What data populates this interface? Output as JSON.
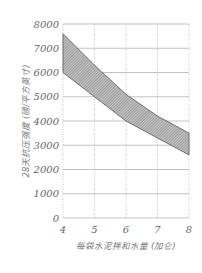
{
  "chart_data": {
    "type": "area",
    "title": "",
    "xlabel": "每袋水泥拌和水量 (加仑)",
    "ylabel": "28天抗压强度 (磅/平方英寸)",
    "xlim": [
      4,
      8
    ],
    "ylim": [
      0,
      8000
    ],
    "x_ticks": [
      4,
      5,
      6,
      7,
      8
    ],
    "y_ticks": [
      0,
      1000,
      2000,
      3000,
      4000,
      5000,
      6000,
      7000,
      8000
    ],
    "grid": true,
    "legend": "none",
    "x": [
      4,
      5,
      6,
      7,
      8
    ],
    "series": [
      {
        "name": "upper bound",
        "values": [
          7600,
          6300,
          5100,
          4200,
          3500
        ]
      },
      {
        "name": "lower bound",
        "values": [
          6000,
          5000,
          4000,
          3300,
          2600
        ]
      }
    ],
    "fill": "hatched band between upper and lower bound"
  },
  "colors": {
    "grid": "#9a9a9a",
    "band": "#8a8a8a",
    "text": "#666666"
  }
}
